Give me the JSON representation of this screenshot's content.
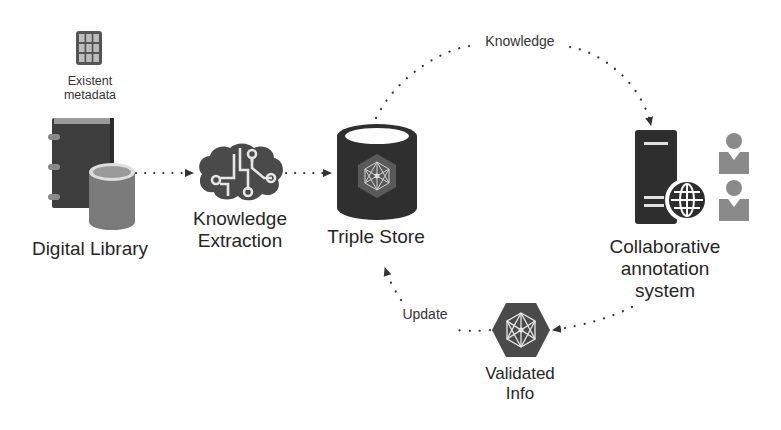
{
  "diagram": {
    "nodes": {
      "metadata": {
        "label_line1": "Existent",
        "label_line2": "metadata",
        "icon": "grid-table-icon"
      },
      "library": {
        "label": "Digital Library",
        "icon": "book-database-icon"
      },
      "extraction": {
        "label_line1": "Knowledge",
        "label_line2": "Extraction",
        "icon": "brain-circuit-icon"
      },
      "triple_store": {
        "label": "Triple Store",
        "icon": "database-graph-icon"
      },
      "annotation": {
        "label_line1": "Collaborative",
        "label_line2": "annotation",
        "label_line3": "system",
        "icon": "server-globe-users-icon"
      },
      "validated": {
        "label_line1": "Validated",
        "label_line2": "Info",
        "icon": "hexagon-graph-icon"
      }
    },
    "edges": [
      {
        "from": "Digital Library",
        "to": "Knowledge Extraction",
        "label": ""
      },
      {
        "from": "Knowledge Extraction",
        "to": "Triple Store",
        "label": ""
      },
      {
        "from": "Triple Store",
        "to": "Collaborative annotation system",
        "label": "Knowledge"
      },
      {
        "from": "Collaborative annotation system",
        "to": "Validated Info",
        "label": ""
      },
      {
        "from": "Validated Info",
        "to": "Triple Store",
        "label": "Update"
      }
    ],
    "edge_labels": {
      "knowledge": "Knowledge",
      "update": "Update"
    },
    "colors": {
      "dark": "#3a3a3a",
      "medium": "#6e6e6e",
      "light": "#9a9a9a",
      "dots": "#333333"
    }
  }
}
